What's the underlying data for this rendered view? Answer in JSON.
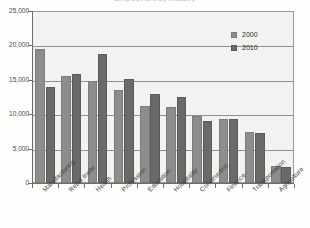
{
  "chart_data": {
    "type": "bar",
    "title": "Employment by industry",
    "xlabel": "",
    "ylabel": "",
    "ylim": [
      0,
      25000
    ],
    "ytick_labels": [
      "0",
      "5,000",
      "10,000",
      "15,000",
      "20,000",
      "25,000"
    ],
    "ytick_values": [
      0,
      5000,
      10000,
      15000,
      20000,
      25000
    ],
    "grid": true,
    "legend_position": "top-right",
    "categories": [
      "Manufacturing",
      "Retail trade",
      "Health",
      "Profession",
      "Education",
      "Hospitality",
      "Construction",
      "Finance",
      "Transportation",
      "Agriculture"
    ],
    "series": [
      {
        "name": "2000",
        "color": "#8d8d8b",
        "values": [
          19500,
          15600,
          14800,
          13500,
          11200,
          11100,
          9800,
          9300,
          7400,
          2500
        ]
      },
      {
        "name": "2010",
        "color": "#6a6a68",
        "values": [
          14000,
          15800,
          18700,
          15100,
          13000,
          12500,
          9000,
          9300,
          7200,
          2300
        ]
      }
    ]
  },
  "legend": {
    "items": [
      {
        "label": "2000"
      },
      {
        "label": "2010"
      }
    ]
  }
}
